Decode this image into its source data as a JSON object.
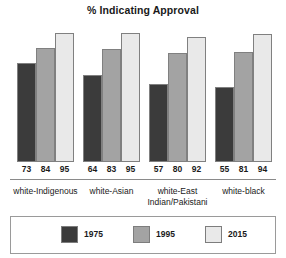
{
  "chart_data": {
    "type": "bar",
    "title": "% Indicating Approval",
    "xlabel": "",
    "ylabel": "",
    "ylim": [
      0,
      100
    ],
    "grid": false,
    "legend_position": "bottom",
    "categories": [
      "white-Indigenous",
      "white-Asian",
      "white-East Indian/Pakistani",
      "white-black"
    ],
    "category_lines": [
      [
        "white-Indigenous"
      ],
      [
        "white-Asian"
      ],
      [
        "white-East",
        "Indian/Pakistani"
      ],
      [
        "white-black"
      ]
    ],
    "series": [
      {
        "name": "1975",
        "color": "#3b3b3b",
        "values": [
          73,
          64,
          57,
          55
        ]
      },
      {
        "name": "1995",
        "color": "#a3a3a3",
        "values": [
          84,
          83,
          80,
          81
        ]
      },
      {
        "name": "2015",
        "color": "#e9e9e9",
        "values": [
          95,
          95,
          92,
          94
        ]
      }
    ],
    "data_labels": [
      [
        "73",
        "84",
        "95"
      ],
      [
        "64",
        "83",
        "95"
      ],
      [
        "57",
        "80",
        "92"
      ],
      [
        "55",
        "81",
        "94"
      ]
    ]
  },
  "legend": {
    "items": [
      {
        "label": "1975",
        "color": "#3b3b3b"
      },
      {
        "label": "1995",
        "color": "#a3a3a3"
      },
      {
        "label": "2015",
        "color": "#e9e9e9"
      }
    ]
  }
}
